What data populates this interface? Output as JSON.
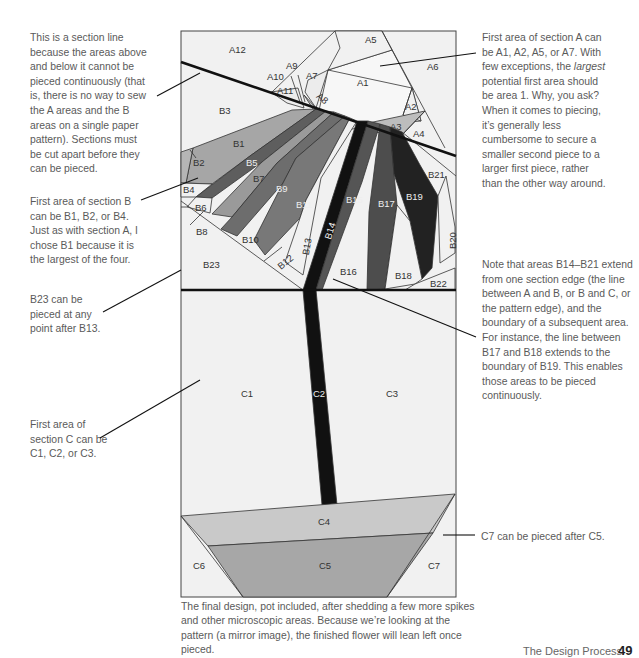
{
  "notes": {
    "section_line": "This is a section line because the areas above and below it cannot be pieced continuously (that is, there is no way to sew the A areas and the B areas on a single paper pattern). Sections must be cut apart before they can be pieced.",
    "section_b_first": "First area of section B can be B1, B2, or B4. Just as with section A, I chose B1 because it is the largest of the four.",
    "b23": "B23 can be pieced at any point after B13.",
    "section_c_first": "First area of section C can be C1, C2, or C3.",
    "section_a_first_pre": "First area of section A can be A1, A2, A5, or A7. With few exceptions, the ",
    "section_a_first_em": "largest",
    "section_a_first_post": " potential first area should be area 1. Why, you ask? When it comes to piecing, it’s generally less cumbersome to secure a smaller second piece to a larger first piece, rather than the other way around.",
    "b14_b21": "Note that areas B14–B21 extend from one section edge (the line between A and B, or B and C, or the pattern edge), and the boundary of a subsequent area. For instance, the line between B17 and B18 extends to the boundary of B19. This enables those areas to be pieced continuously.",
    "c7": "C7 can be pieced after C5."
  },
  "caption": "The final design, pot included, after shedding a few more spikes and other microscopic areas. Because we’re looking at the pattern (a mirror image), the finished flower will lean left once pieced.",
  "footer": {
    "title": "The Design Process",
    "page": "49"
  },
  "labels": {
    "A1": "A1",
    "A2": "A2",
    "A3": "A3",
    "A4": "A4",
    "A5": "A5",
    "A6": "A6",
    "A7": "A7",
    "A8": "A8",
    "A9": "A9",
    "A10": "A10",
    "A11": "A11",
    "A12": "A12",
    "B1": "B1",
    "B2": "B2",
    "B3": "B3",
    "B4": "B4",
    "B5": "B5",
    "B6": "B6",
    "B7": "B7",
    "B8": "B8",
    "B9": "B9",
    "B10": "B10",
    "B11": "B11",
    "B12": "B12",
    "B13": "B13",
    "B14": "B14",
    "B15": "B15",
    "B16": "B16",
    "B17": "B17",
    "B18": "B18",
    "B19": "B19",
    "B20": "B20",
    "B21": "B21",
    "B22": "B22",
    "B23": "B23",
    "C1": "C1",
    "C2": "C2",
    "C3": "C3",
    "C4": "C4",
    "C5": "C5",
    "C6": "C6",
    "C7": "C7"
  },
  "colors": {
    "background": "#f1f1f1",
    "outline": "#333333",
    "section_line": "#111111",
    "light_gray": "#c4c4c4",
    "mid_gray": "#9a9a9a",
    "gray": "#7d7d7d",
    "dark_gray": "#5b5b5b",
    "darker_gray": "#444444",
    "near_black": "#2a2a2a",
    "black": "#111111",
    "pot_top": "#c9c9c9",
    "pot_bottom": "#a7a7a7"
  }
}
